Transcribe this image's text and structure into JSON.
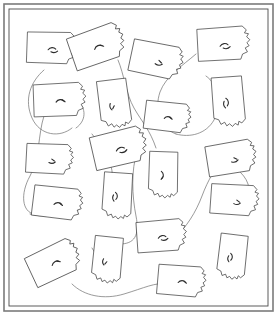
{
  "figure": {
    "title": "",
    "kind": "scattered-outline-diagram",
    "width": 277,
    "height": 315,
    "background_color": "#ffffff",
    "frame": {
      "name": "outer-border",
      "outer_color": "#7b7b7b",
      "inner_color": "#4a4a4a",
      "outer_stroke_width": 1.6,
      "inner_stroke_width": 0.9,
      "outer_rect": {
        "x": 4,
        "y": 4,
        "width": 269,
        "height": 307
      },
      "inner_rect": {
        "x": 9,
        "y": 9,
        "width": 259,
        "height": 297
      }
    },
    "outline_style": {
      "stroke_color": "#3a3a3a",
      "stroke_width": 0.7,
      "fill_color": "#ffffff"
    },
    "connector_style": {
      "stroke_color": "#6e6e6e",
      "stroke_width": 0.7
    },
    "shape_name": "pennsylvania-outline",
    "shape_count": 20,
    "connector_count": 10
  },
  "chart_data": {
    "type": "scatter",
    "title": "",
    "xlabel": "",
    "ylabel": "",
    "xlim": [
      0,
      277
    ],
    "ylim": [
      0,
      315
    ],
    "grid": false,
    "legend": "none",
    "note": "Twenty congruent Pennsylvania-shaped outlines placed at varied positions, rotations and scales, linked by thin freehand curves.",
    "series": [
      {
        "name": "pennsylvania-outlines",
        "marker": "pennsylvania-outline",
        "points": [
          {
            "id": "shape-01",
            "x": 52,
            "y": 48,
            "rotation": 2,
            "scale": 0.95
          },
          {
            "id": "shape-02",
            "x": 98,
            "y": 46,
            "rotation": -19,
            "scale": 1.05
          },
          {
            "id": "shape-03",
            "x": 157,
            "y": 60,
            "rotation": 12,
            "scale": 1.0
          },
          {
            "id": "shape-04",
            "x": 224,
            "y": 44,
            "rotation": -3,
            "scale": 1.0
          },
          {
            "id": "shape-05",
            "x": 60,
            "y": 100,
            "rotation": -2,
            "scale": 1.0
          },
          {
            "id": "shape-06",
            "x": 114,
            "y": 104,
            "rotation": 83,
            "scale": 0.92
          },
          {
            "id": "shape-07",
            "x": 228,
            "y": 102,
            "rotation": 86,
            "scale": 0.95
          },
          {
            "id": "shape-08",
            "x": 168,
            "y": 117,
            "rotation": 7,
            "scale": 0.88
          },
          {
            "id": "shape-09",
            "x": 50,
            "y": 159,
            "rotation": 3,
            "scale": 0.9
          },
          {
            "id": "shape-10",
            "x": 120,
            "y": 148,
            "rotation": -13,
            "scale": 1.05
          },
          {
            "id": "shape-11",
            "x": 163,
            "y": 175,
            "rotation": 92,
            "scale": 0.88
          },
          {
            "id": "shape-12",
            "x": 232,
            "y": 158,
            "rotation": -9,
            "scale": 0.95
          },
          {
            "id": "shape-13",
            "x": 117,
            "y": 196,
            "rotation": 94,
            "scale": 0.88
          },
          {
            "id": "shape-14",
            "x": 58,
            "y": 203,
            "rotation": 7,
            "scale": 0.95
          },
          {
            "id": "shape-15",
            "x": 235,
            "y": 200,
            "rotation": 4,
            "scale": 0.92
          },
          {
            "id": "shape-16",
            "x": 162,
            "y": 236,
            "rotation": -4,
            "scale": 0.95
          },
          {
            "id": "shape-17",
            "x": 55,
            "y": 262,
            "rotation": -25,
            "scale": 1.0
          },
          {
            "id": "shape-18",
            "x": 107,
            "y": 260,
            "rotation": 96,
            "scale": 0.88
          },
          {
            "id": "shape-19",
            "x": 232,
            "y": 257,
            "rotation": 97,
            "scale": 0.85
          },
          {
            "id": "shape-20",
            "x": 182,
            "y": 281,
            "rotation": 5,
            "scale": 0.92
          }
        ]
      }
    ]
  },
  "accessibility": {
    "alt_text": "Twenty outlined map shapes scattered across a bordered white page and joined by thin curved lines."
  }
}
